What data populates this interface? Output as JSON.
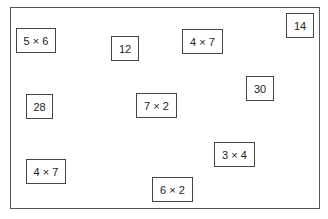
{
  "cards": [
    {
      "label": "5 × 6",
      "x": 16,
      "y": 28,
      "w": 40,
      "h": 25
    },
    {
      "label": "12",
      "x": 111,
      "y": 36,
      "w": 28,
      "h": 25
    },
    {
      "label": "4 × 7",
      "x": 182,
      "y": 29,
      "w": 41,
      "h": 25
    },
    {
      "label": "14",
      "x": 286,
      "y": 13,
      "w": 28,
      "h": 25
    },
    {
      "label": "28",
      "x": 26,
      "y": 94,
      "w": 27,
      "h": 25
    },
    {
      "label": "7 × 2",
      "x": 136,
      "y": 93,
      "w": 41,
      "h": 25
    },
    {
      "label": "30",
      "x": 246,
      "y": 76,
      "w": 28,
      "h": 25
    },
    {
      "label": "4 × 7",
      "x": 26,
      "y": 159,
      "w": 40,
      "h": 25
    },
    {
      "label": "3 × 4",
      "x": 214,
      "y": 142,
      "w": 41,
      "h": 25
    },
    {
      "label": "6 × 2",
      "x": 152,
      "y": 177,
      "w": 41,
      "h": 25
    }
  ]
}
